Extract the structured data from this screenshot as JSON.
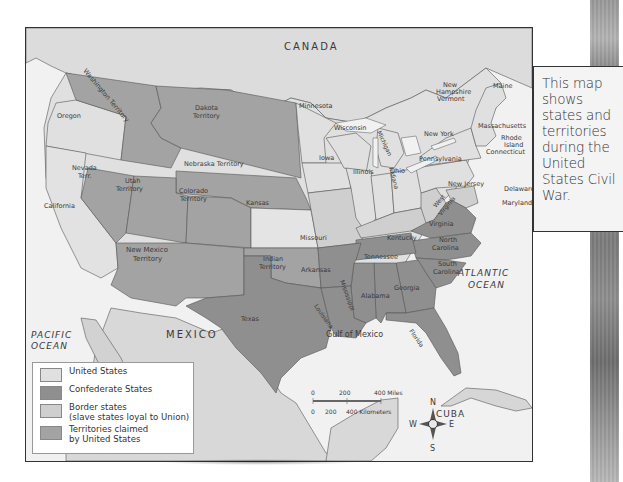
{
  "caption": {
    "text": "This map shows states and territories during the United States Civil War.",
    "lines": [
      "This map",
      "shows",
      "states and",
      "territories",
      "during the",
      "United",
      "States Civil",
      "War."
    ]
  },
  "colors": {
    "united_states": "#e0e0e0",
    "confederate_states": "#8f8f8f",
    "border_states": "#cfcfcf",
    "territories": "#a3a3a3",
    "foreign_land": "#d6d6d6",
    "water": "#f0f0f0",
    "frame": "#333333"
  },
  "map": {
    "regions": {
      "canada": "CANADA",
      "mexico": "MEXICO",
      "cuba": "CUBA"
    },
    "water_bodies": {
      "pacific": [
        "PACIFIC",
        "OCEAN"
      ],
      "atlantic": [
        "ATLANTIC",
        "OCEAN"
      ],
      "gulf": "Gulf of Mexico"
    },
    "union_states": {
      "oregon": "Oregon",
      "california": "California",
      "kansas": "Kansas",
      "minnesota": "Minnesota",
      "iowa": "Iowa",
      "wisconsin": "Wisconsin",
      "michigan": "Michigan",
      "illinois": "Illinois",
      "indiana": "Indiana",
      "ohio": "Ohio",
      "pennsylvania": "Pennsylvania",
      "new_york": "New York",
      "new_jersey": "New Jersey",
      "vermont": "Vermont",
      "new_hampshire": [
        "New",
        "Hampshire"
      ],
      "maine": "Maine",
      "massachusetts": "Massachusetts",
      "rhode_island": [
        "Rhode",
        "Island"
      ],
      "connecticut": "Connecticut"
    },
    "border_states": {
      "missouri": "Missouri",
      "kentucky": "Kentucky",
      "west_virginia": [
        "West",
        "Virginia"
      ],
      "maryland": "Maryland",
      "delaware": "Delaware"
    },
    "confederate_states": {
      "texas": "Texas",
      "arkansas": "Arkansas",
      "louisiana": "Louisiana",
      "mississippi": "Mississippi",
      "alabama": "Alabama",
      "georgia": "Georgia",
      "florida": "Florida",
      "tennessee": "Tennessee",
      "south_carolina": [
        "South",
        "Carolina"
      ],
      "north_carolina": [
        "North",
        "Carolina"
      ],
      "virginia": "Virginia"
    },
    "territories": {
      "washington": "Washington Territory",
      "dakota": [
        "Dakota",
        "Territory"
      ],
      "nebraska": "Nebraska Territory",
      "nevada": [
        "Nevada",
        "Terr."
      ],
      "utah": [
        "Utah",
        "Territory"
      ],
      "colorado": [
        "Colorado",
        "Territory"
      ],
      "new_mexico": [
        "New Mexico",
        "Territory"
      ],
      "indian": [
        "Indian",
        "Territory"
      ]
    },
    "scale_bar": {
      "miles_labels": [
        "0",
        "200",
        "400 Miles"
      ],
      "km_labels": [
        "0",
        "200",
        "400 Kilometers"
      ]
    },
    "compass": {
      "n": "N",
      "s": "S",
      "e": "E",
      "w": "W"
    }
  },
  "legend": {
    "items": [
      {
        "label": "United States",
        "color": "#e0e0e0"
      },
      {
        "label": "Confederate States",
        "color": "#8f8f8f"
      },
      {
        "label": "Border states",
        "sublabel": "(slave states loyal to Union)",
        "color": "#cfcfcf"
      },
      {
        "label": "Territories claimed",
        "sublabel": "by United States",
        "color": "#a3a3a3"
      }
    ]
  }
}
